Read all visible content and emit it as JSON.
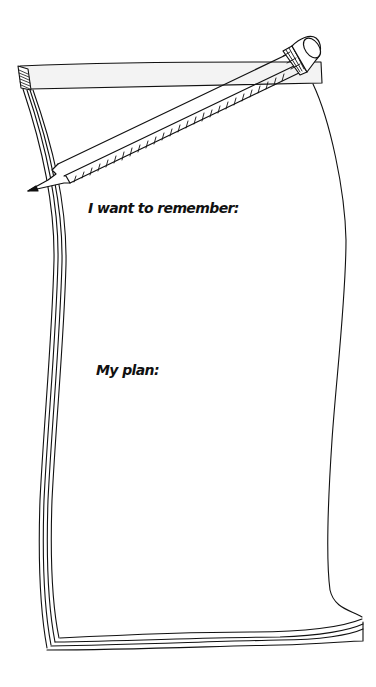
{
  "worksheet": {
    "prompts": [
      {
        "id": "remember",
        "label": "I want to remember:"
      },
      {
        "id": "plan",
        "label": "My plan:"
      }
    ],
    "illustration": {
      "objects": [
        "notepad",
        "pencil"
      ]
    }
  },
  "colors": {
    "ink": "#111111",
    "paper": "#ffffff",
    "strip_fill": "#f2f2f2"
  }
}
